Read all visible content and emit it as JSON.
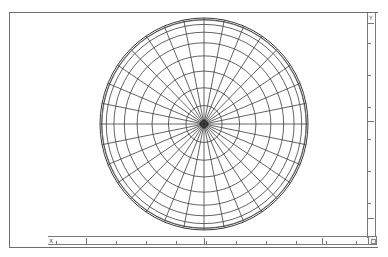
{
  "viewport": {
    "view": "polar wireframe sphere",
    "wire_color": "#3c3c3c",
    "frame_color": "#6e6e6e",
    "sphere": {
      "longitude_divisions": 32,
      "latitude_step_degrees": 10,
      "latitude_rings": 9
    }
  },
  "rulers": {
    "horizontal": {
      "axis_label": "X",
      "major_ticks": 3,
      "minor_ticks_between": 3
    },
    "vertical": {
      "axis_label": "Y",
      "major_ticks": 3,
      "minor_ticks_between": 3
    }
  },
  "corner_button": {
    "icon": "view-toggle-icon"
  }
}
